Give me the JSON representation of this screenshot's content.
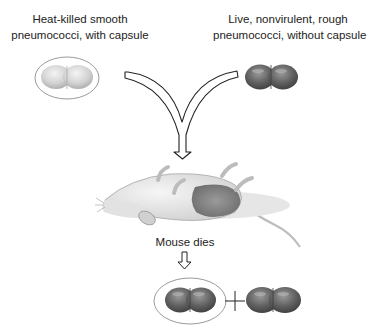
{
  "diagram": {
    "inputs": [
      {
        "label_line1": "Heat-killed smooth",
        "label_line2": "pneumococci, with capsule",
        "capsule": true,
        "cell_color": "#d6d6d6"
      },
      {
        "label_line1": "Live, nonvirulent, rough",
        "label_line2": "pneumococci, without capsule",
        "capsule": false,
        "cell_color": "#6e6e6e"
      }
    ],
    "outcome_label": "Mouse dies",
    "result": {
      "items": [
        "Smooth pneumococci with capsule",
        "Rough pneumococci without capsule"
      ],
      "operator": "+"
    },
    "colors": {
      "outline": "#222222",
      "capsule_stroke": "#9a9a9a",
      "dark_cell": "#5f5f5f",
      "light_cell": "#d4d4d4"
    }
  }
}
